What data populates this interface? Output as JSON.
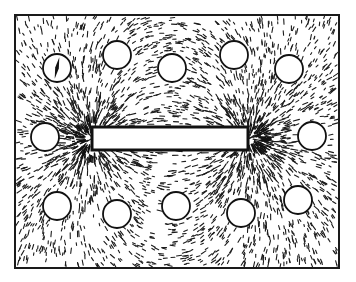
{
  "figure": {
    "canvas": {
      "width": 356,
      "height": 282
    },
    "frame": {
      "x": 15,
      "y": 15,
      "width": 324,
      "height": 253,
      "stroke": "#1a1a1a",
      "stroke_width": 2
    },
    "colors": {
      "background": "#ffffff",
      "ink": "#111111",
      "filings": "#1c1c1c"
    },
    "magnet": {
      "x": 92,
      "y": 127,
      "width": 156,
      "height": 23,
      "fill": "#ffffff",
      "stroke": "#111111",
      "stroke_width": 3
    },
    "poles": [
      {
        "x": 92,
        "y": 138.5
      },
      {
        "x": 248,
        "y": 138.5
      }
    ],
    "filings": {
      "count": 5200,
      "seed": 7,
      "min_len": 2,
      "max_len": 7,
      "stroke_width": 1.1
    },
    "compasses": [
      {
        "cx": 57,
        "cy": 68,
        "r": 14,
        "needle": true,
        "needle_angle_deg": 102
      },
      {
        "cx": 117,
        "cy": 55,
        "r": 14,
        "needle": false
      },
      {
        "cx": 172,
        "cy": 68,
        "r": 14,
        "needle": false
      },
      {
        "cx": 234,
        "cy": 55,
        "r": 14,
        "needle": false
      },
      {
        "cx": 289,
        "cy": 69,
        "r": 14,
        "needle": false
      },
      {
        "cx": 45,
        "cy": 137,
        "r": 14,
        "needle": false
      },
      {
        "cx": 312,
        "cy": 136,
        "r": 14,
        "needle": false
      },
      {
        "cx": 57,
        "cy": 206,
        "r": 14,
        "needle": false
      },
      {
        "cx": 117,
        "cy": 214,
        "r": 14,
        "needle": false
      },
      {
        "cx": 176,
        "cy": 206,
        "r": 14,
        "needle": false
      },
      {
        "cx": 241,
        "cy": 213,
        "r": 14,
        "needle": false
      },
      {
        "cx": 298,
        "cy": 200,
        "r": 14,
        "needle": false
      }
    ]
  }
}
